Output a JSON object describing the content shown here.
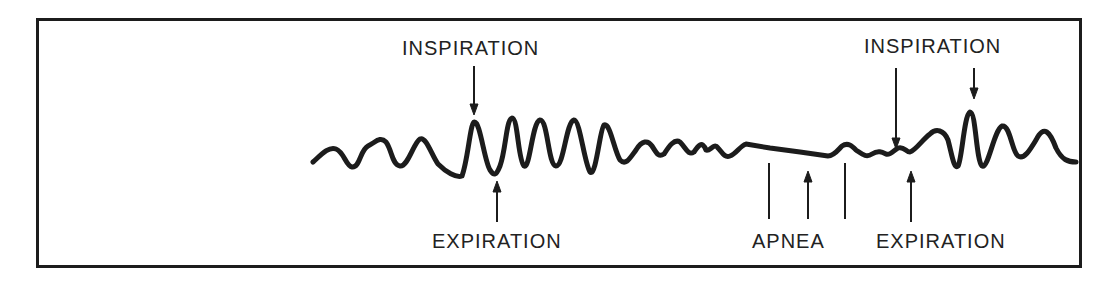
{
  "diagram": {
    "labels": {
      "inspiration_left": "INSPIRATION",
      "expiration_left": "EXPIRATION",
      "apnea": "APNEA",
      "expiration_right": "EXPIRATION",
      "inspiration_right": "INSPIRATION"
    },
    "colors": {
      "line": "#1c1c1c",
      "text": "#222222",
      "background": "#ffffff"
    },
    "phases": [
      "normal breathing",
      "apnea",
      "recovery breathing"
    ]
  }
}
